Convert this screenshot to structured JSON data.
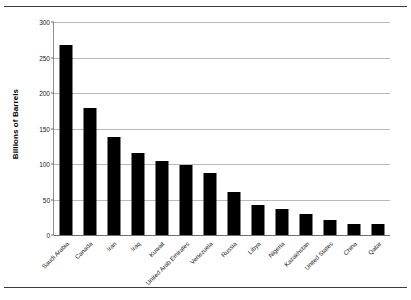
{
  "chart_data": {
    "type": "bar",
    "title": "",
    "xlabel": "",
    "ylabel": "Billions of Barrels",
    "ylim": [
      0,
      300
    ],
    "yticks": [
      0,
      50,
      100,
      150,
      200,
      250,
      300
    ],
    "grid": true,
    "legend": "none",
    "bar_color": "#000000",
    "gridline_color": "#b9b9b9",
    "categories": [
      "Saudi Arabia",
      "Canada",
      "Iran",
      "Iraq",
      "Kuwait",
      "United Arab Emirates",
      "Venezuela",
      "Russia",
      "Libya",
      "Nigeria",
      "Kazakhstan",
      "United States",
      "China",
      "Qatar"
    ],
    "values": [
      267,
      179,
      138,
      115,
      104,
      98,
      88,
      60,
      42,
      36,
      30,
      21,
      16,
      15
    ],
    "ytick_labels": [
      "0",
      "50",
      "100",
      "150",
      "200",
      "250",
      "300"
    ]
  }
}
